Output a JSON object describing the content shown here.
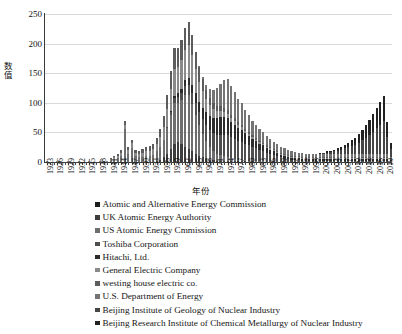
{
  "chart_data": {
    "type": "bar",
    "stacked": true,
    "title": "",
    "xlabel": "年份",
    "ylabel": "数值",
    "ylim": [
      0,
      250
    ],
    "yticks": [
      0,
      50,
      100,
      150,
      200,
      250
    ],
    "grid": true,
    "legend_position": "below",
    "x_tick_step": 3,
    "x": [
      1923,
      1924,
      1925,
      1926,
      1927,
      1928,
      1929,
      1930,
      1931,
      1932,
      1933,
      1934,
      1935,
      1936,
      1937,
      1938,
      1939,
      1940,
      1941,
      1942,
      1943,
      1944,
      1945,
      1946,
      1947,
      1948,
      1949,
      1950,
      1951,
      1952,
      1953,
      1954,
      1955,
      1956,
      1957,
      1958,
      1959,
      1960,
      1961,
      1962,
      1963,
      1964,
      1965,
      1966,
      1967,
      1968,
      1969,
      1970,
      1971,
      1972,
      1973,
      1974,
      1975,
      1976,
      1977,
      1978,
      1979,
      1980,
      1981,
      1982,
      1983,
      1984,
      1985,
      1986,
      1987,
      1988,
      1989,
      1990,
      1991,
      1992,
      1993,
      1994,
      1995,
      1996,
      1997,
      1998,
      1999,
      2000,
      2001,
      2002,
      2003,
      2004,
      2005,
      2006,
      2007,
      2008,
      2009,
      2010,
      2011,
      2012,
      2013,
      2014,
      2015,
      2016,
      2017,
      2018,
      2019,
      2020
    ],
    "categories": [
      "1923",
      "1924",
      "1925",
      "1926",
      "1927",
      "1928",
      "1929",
      "1930",
      "1931",
      "1932",
      "1933",
      "1934",
      "1935",
      "1936",
      "1937",
      "1938",
      "1939",
      "1940",
      "1941",
      "1942",
      "1943",
      "1944",
      "1945",
      "1946",
      "1947",
      "1948",
      "1949",
      "1950",
      "1951",
      "1952",
      "1953",
      "1954",
      "1955",
      "1956",
      "1957",
      "1958",
      "1959",
      "1960",
      "1961",
      "1962",
      "1963",
      "1964",
      "1965",
      "1966",
      "1967",
      "1968",
      "1969",
      "1970",
      "1971",
      "1972",
      "1973",
      "1974",
      "1975",
      "1976",
      "1977",
      "1978",
      "1979",
      "1980",
      "1981",
      "1982",
      "1983",
      "1984",
      "1985",
      "1986",
      "1987",
      "1988",
      "1989",
      "1990",
      "1991",
      "1992",
      "1993",
      "1994",
      "1995",
      "1996",
      "1997",
      "1998",
      "1999",
      "2000",
      "2001",
      "2002",
      "2003",
      "2004",
      "2005",
      "2006",
      "2007",
      "2008",
      "2009",
      "2010",
      "2011",
      "2012",
      "2013",
      "2014",
      "2015",
      "2016",
      "2017",
      "2018",
      "2019",
      "2020"
    ],
    "tick_labels": [
      "1923",
      "1926",
      "1929",
      "1932",
      "1935",
      "1938",
      "1941",
      "1944",
      "1947",
      "1950",
      "1953",
      "1956",
      "1959",
      "1962",
      "1965",
      "1968",
      "1971",
      "1974",
      "1977",
      "1980",
      "1983",
      "1986",
      "1989",
      "1992",
      "1995",
      "1998",
      "2001",
      "2004",
      "2007",
      "2010",
      "2013",
      "2016",
      "2019"
    ],
    "series": [
      {
        "name": "Atomic and Alternative Energy Commission",
        "color": "#1c1c1c",
        "values": [
          0,
          0,
          0,
          0,
          0,
          0,
          0,
          0,
          0,
          0,
          0,
          0,
          0,
          0,
          0,
          0,
          0,
          0,
          0,
          0,
          0,
          0,
          0,
          0,
          0,
          0,
          0,
          0,
          0,
          0,
          0,
          0,
          0,
          0,
          0,
          0,
          0,
          0,
          0,
          0,
          0,
          0,
          0,
          0,
          0,
          0,
          0,
          0,
          0,
          0,
          0,
          0,
          0,
          0,
          0,
          0,
          0,
          0,
          0,
          0,
          0,
          0,
          0,
          0,
          0,
          0,
          0,
          0,
          0,
          0,
          0,
          0,
          0,
          0,
          0,
          0,
          0,
          0,
          0,
          0,
          0,
          0,
          0,
          0,
          0,
          0,
          0,
          0,
          0,
          0,
          0,
          0,
          0,
          0,
          0,
          0,
          0,
          0
        ]
      },
      {
        "name": "UK Atomic Energy Authority",
        "color": "#3d3d3d",
        "values": [
          0,
          0,
          0,
          0,
          0,
          0,
          0,
          0,
          0,
          0,
          0,
          0,
          0,
          0,
          0,
          0,
          0,
          0,
          0,
          0,
          0,
          0,
          0,
          0,
          0,
          0,
          0,
          0,
          0,
          0,
          0,
          2,
          4,
          8,
          14,
          22,
          30,
          34,
          30,
          26,
          22,
          18,
          14,
          10,
          8,
          6,
          4,
          3,
          2,
          2,
          2,
          2,
          1,
          1,
          1,
          1,
          1,
          0,
          0,
          0,
          0,
          0,
          0,
          0,
          0,
          0,
          0,
          0,
          0,
          0,
          0,
          0,
          0,
          0,
          0,
          0,
          0,
          0,
          0,
          0,
          0,
          0,
          0,
          0,
          0,
          0,
          0,
          0,
          0,
          0,
          0,
          0,
          0,
          0,
          0,
          0,
          0,
          0
        ]
      },
      {
        "name": "US Atomic Energy Cmmission",
        "color": "#6e6e6e",
        "values": [
          0,
          0,
          0,
          0,
          0,
          0,
          0,
          0,
          0,
          0,
          0,
          0,
          0,
          0,
          0,
          0,
          0,
          0,
          2,
          4,
          6,
          10,
          55,
          14,
          24,
          10,
          8,
          9,
          10,
          10,
          12,
          16,
          22,
          30,
          44,
          58,
          70,
          66,
          74,
          88,
          92,
          80,
          66,
          52,
          40,
          30,
          22,
          16,
          12,
          10,
          8,
          6,
          5,
          4,
          3,
          3,
          2,
          2,
          1,
          1,
          1,
          1,
          0,
          0,
          0,
          0,
          0,
          0,
          0,
          0,
          0,
          0,
          0,
          0,
          0,
          0,
          0,
          0,
          0,
          0,
          0,
          0,
          0,
          0,
          0,
          0,
          0,
          0,
          0,
          0,
          0,
          0,
          0,
          0,
          0,
          0,
          0,
          0
        ]
      },
      {
        "name": "Toshiba Corporation",
        "color": "#4f4f4f",
        "values": [
          0,
          0,
          0,
          0,
          0,
          0,
          0,
          0,
          0,
          0,
          0,
          0,
          0,
          0,
          0,
          0,
          0,
          0,
          0,
          0,
          0,
          0,
          0,
          0,
          0,
          0,
          0,
          0,
          0,
          0,
          0,
          0,
          0,
          0,
          2,
          4,
          8,
          10,
          12,
          14,
          16,
          18,
          20,
          22,
          24,
          26,
          28,
          30,
          32,
          34,
          36,
          38,
          36,
          34,
          32,
          30,
          28,
          26,
          24,
          22,
          20,
          18,
          16,
          14,
          12,
          10,
          8,
          6,
          5,
          4,
          3,
          3,
          2,
          2,
          2,
          2,
          2,
          2,
          2,
          2,
          2,
          2,
          2,
          2,
          2,
          2,
          2,
          2,
          2,
          2,
          2,
          2,
          2,
          2,
          2,
          2,
          2,
          1
        ]
      },
      {
        "name": "Hitachi, Ltd.",
        "color": "#2b2b2b",
        "values": [
          0,
          0,
          0,
          0,
          0,
          0,
          0,
          0,
          0,
          0,
          0,
          0,
          0,
          0,
          0,
          0,
          0,
          0,
          0,
          0,
          0,
          0,
          0,
          0,
          0,
          0,
          0,
          0,
          0,
          0,
          0,
          0,
          0,
          0,
          0,
          2,
          4,
          6,
          8,
          10,
          12,
          14,
          16,
          18,
          20,
          22,
          24,
          26,
          28,
          30,
          30,
          28,
          26,
          24,
          22,
          20,
          18,
          16,
          14,
          12,
          10,
          9,
          8,
          7,
          6,
          5,
          4,
          4,
          3,
          3,
          3,
          3,
          3,
          3,
          3,
          3,
          3,
          3,
          3,
          3,
          3,
          3,
          3,
          3,
          3,
          3,
          3,
          3,
          3,
          3,
          3,
          3,
          3,
          3,
          3,
          3,
          3,
          2
        ]
      },
      {
        "name": "General Electric Company",
        "color": "#8a8a8a",
        "values": [
          1,
          0,
          0,
          1,
          0,
          0,
          1,
          0,
          0,
          1,
          0,
          0,
          1,
          0,
          0,
          1,
          2,
          2,
          3,
          4,
          5,
          6,
          8,
          6,
          8,
          6,
          6,
          7,
          8,
          9,
          10,
          12,
          16,
          22,
          30,
          38,
          46,
          44,
          48,
          52,
          56,
          50,
          42,
          34,
          28,
          22,
          18,
          14,
          12,
          10,
          9,
          8,
          7,
          6,
          5,
          5,
          4,
          4,
          3,
          3,
          3,
          2,
          2,
          2,
          2,
          2,
          2,
          2,
          2,
          2,
          2,
          2,
          2,
          2,
          2,
          2,
          2,
          2,
          2,
          2,
          2,
          2,
          2,
          2,
          2,
          2,
          2,
          2,
          2,
          2,
          2,
          2,
          2,
          2,
          2,
          2,
          2,
          1
        ]
      },
      {
        "name": "westing house electric co.",
        "color": "#5c5c5c",
        "values": [
          0,
          0,
          0,
          0,
          0,
          0,
          0,
          0,
          0,
          0,
          0,
          0,
          0,
          0,
          0,
          0,
          0,
          0,
          1,
          2,
          3,
          4,
          6,
          5,
          6,
          5,
          5,
          6,
          7,
          8,
          9,
          11,
          14,
          18,
          24,
          30,
          34,
          32,
          34,
          36,
          38,
          34,
          28,
          24,
          20,
          16,
          13,
          10,
          9,
          8,
          7,
          6,
          5,
          5,
          4,
          4,
          3,
          3,
          3,
          2,
          2,
          2,
          2,
          2,
          2,
          2,
          2,
          2,
          2,
          2,
          2,
          2,
          2,
          2,
          2,
          2,
          2,
          2,
          2,
          2,
          2,
          2,
          2,
          2,
          2,
          2,
          2,
          2,
          2,
          2,
          2,
          2,
          2,
          2,
          2,
          2,
          2,
          1
        ]
      },
      {
        "name": "U.S. Department of Energy",
        "color": "#747474",
        "values": [
          0,
          0,
          0,
          0,
          0,
          0,
          0,
          0,
          0,
          0,
          0,
          0,
          0,
          0,
          0,
          0,
          0,
          0,
          0,
          0,
          0,
          0,
          0,
          0,
          0,
          0,
          0,
          0,
          0,
          0,
          0,
          0,
          0,
          0,
          0,
          0,
          0,
          0,
          0,
          0,
          0,
          0,
          0,
          2,
          4,
          8,
          14,
          22,
          30,
          38,
          46,
          52,
          48,
          44,
          40,
          36,
          32,
          28,
          24,
          22,
          20,
          18,
          16,
          14,
          12,
          11,
          10,
          9,
          8,
          7,
          7,
          6,
          6,
          5,
          5,
          5,
          4,
          4,
          4,
          4,
          4,
          4,
          4,
          4,
          4,
          4,
          4,
          4,
          4,
          4,
          4,
          4,
          4,
          4,
          4,
          4,
          4,
          3
        ]
      },
      {
        "name": "Beijing Institute of Geology of Nuclear Industry",
        "color": "#454545",
        "values": [
          0,
          0,
          0,
          0,
          0,
          0,
          0,
          0,
          0,
          0,
          0,
          0,
          0,
          0,
          0,
          0,
          0,
          0,
          0,
          0,
          0,
          0,
          0,
          0,
          0,
          0,
          0,
          0,
          0,
          0,
          0,
          0,
          0,
          0,
          0,
          0,
          0,
          0,
          0,
          0,
          0,
          0,
          0,
          0,
          0,
          0,
          0,
          0,
          0,
          0,
          0,
          0,
          0,
          0,
          0,
          0,
          0,
          0,
          0,
          0,
          0,
          0,
          0,
          0,
          0,
          0,
          0,
          0,
          0,
          0,
          0,
          0,
          0,
          0,
          0,
          0,
          0,
          1,
          2,
          3,
          4,
          5,
          6,
          8,
          10,
          12,
          14,
          16,
          20,
          24,
          28,
          32,
          38,
          44,
          50,
          56,
          30,
          14
        ]
      },
      {
        "name": "Beijing Research Institute of Chemical Metallurgy of Nuclear Industry",
        "color": "#222222",
        "values": [
          0,
          0,
          0,
          0,
          0,
          0,
          0,
          0,
          0,
          0,
          0,
          0,
          0,
          0,
          0,
          0,
          0,
          0,
          0,
          0,
          0,
          0,
          0,
          0,
          0,
          0,
          0,
          0,
          0,
          0,
          0,
          0,
          0,
          0,
          0,
          0,
          0,
          0,
          0,
          0,
          0,
          0,
          0,
          0,
          0,
          0,
          0,
          0,
          0,
          0,
          0,
          0,
          0,
          0,
          0,
          0,
          0,
          0,
          0,
          0,
          0,
          0,
          0,
          0,
          0,
          0,
          0,
          0,
          0,
          0,
          0,
          0,
          0,
          0,
          0,
          0,
          0,
          1,
          1,
          2,
          2,
          3,
          4,
          5,
          6,
          8,
          10,
          12,
          14,
          18,
          22,
          26,
          30,
          34,
          38,
          42,
          24,
          10
        ]
      }
    ],
    "totals": [
      1,
      0,
      0,
      1,
      0,
      0,
      1,
      0,
      0,
      1,
      0,
      0,
      1,
      0,
      0,
      1,
      2,
      2,
      6,
      10,
      14,
      20,
      69,
      25,
      38,
      21,
      19,
      22,
      25,
      27,
      31,
      41,
      56,
      78,
      118,
      154,
      192,
      192,
      206,
      226,
      236,
      214,
      186,
      142,
      144,
      130,
      103,
      121,
      123,
      132,
      138,
      140,
      128,
      118,
      107,
      99,
      88,
      79,
      69,
      62,
      56,
      50,
      44,
      39,
      34,
      30,
      26,
      23,
      20,
      18,
      17,
      16,
      16,
      15,
      15,
      15,
      14,
      15,
      17,
      19,
      21,
      23,
      26,
      31,
      37,
      45,
      54,
      63,
      76,
      93,
      111,
      128,
      151,
      174,
      197,
      220,
      128,
      48
    ]
  },
  "axis": {
    "ylabel_chars": [
      "数",
      "值"
    ],
    "xlabel": "年份"
  },
  "legend": {
    "items": [
      {
        "label": "Atomic and Alternative Energy Commission",
        "color": "#1c1c1c"
      },
      {
        "label": "UK Atomic Energy Authority",
        "color": "#3d3d3d"
      },
      {
        "label": "US Atomic Energy Cmmission",
        "color": "#6e6e6e"
      },
      {
        "label": "Toshiba Corporation",
        "color": "#4f4f4f"
      },
      {
        "label": "Hitachi, Ltd.",
        "color": "#2b2b2b"
      },
      {
        "label": "General Electric Company",
        "color": "#8a8a8a"
      },
      {
        "label": "westing house electric co.",
        "color": "#5c5c5c"
      },
      {
        "label": "U.S. Department of Energy",
        "color": "#747474"
      },
      {
        "label": "Beijing Institute of Geology of Nuclear Industry",
        "color": "#454545"
      },
      {
        "label": "Beijing Research Institute of Chemical Metallurgy of Nuclear Industry",
        "color": "#222222"
      }
    ]
  }
}
